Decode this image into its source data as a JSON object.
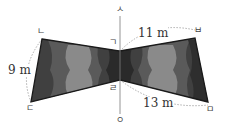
{
  "diagram": {
    "axis": {
      "top_label": "ㅅ",
      "bottom_label": "ㅇ"
    },
    "vertices": {
      "g": "ㄱ",
      "n": "ㄴ",
      "d": "ㄷ",
      "r": "ㄹ",
      "m": "ㅁ",
      "b": "ㅂ"
    },
    "measurements": {
      "nd": "9 m",
      "gb": "11 m",
      "rm": "13 m"
    },
    "colors": {
      "outline": "#1a1a1a",
      "dark": "#3a3a3a",
      "mid": "#5a5a5a",
      "light": "#8a8a8a",
      "axis": "#888888"
    }
  }
}
